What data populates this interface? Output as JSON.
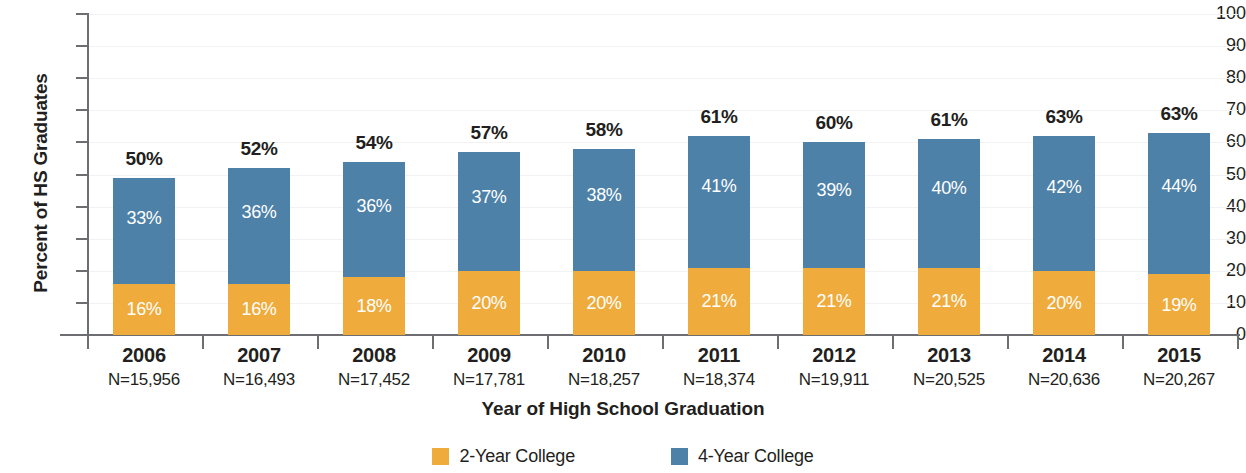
{
  "chart_data": {
    "type": "bar",
    "subtype": "stacked-bar",
    "title": "",
    "xlabel": "Year of High School Graduation",
    "ylabel": "Percent of HS Graduates",
    "ylim": [
      0,
      100
    ],
    "yticks": [
      0,
      10,
      20,
      30,
      40,
      50,
      60,
      70,
      80,
      90,
      100
    ],
    "ytick_labels": [
      "0",
      "10",
      "20",
      "30",
      "40",
      "50",
      "60",
      "70",
      "80",
      "90",
      "100"
    ],
    "grid": true,
    "legend_position": "bottom-center",
    "categories": [
      "2006",
      "2007",
      "2008",
      "2009",
      "2010",
      "2011",
      "2012",
      "2013",
      "2014",
      "2015"
    ],
    "category_sublabels": [
      "N=15,956",
      "N=16,493",
      "N=17,452",
      "N=17,781",
      "N=18,257",
      "N=18,374",
      "N=19,911",
      "N=20,525",
      "N=20,636",
      "N=20,267"
    ],
    "series": [
      {
        "name": "2-Year College",
        "color": "#efab3c",
        "values": [
          16,
          16,
          18,
          20,
          20,
          21,
          21,
          21,
          20,
          19
        ],
        "labels": [
          "16%",
          "16%",
          "18%",
          "20%",
          "20%",
          "21%",
          "21%",
          "21%",
          "20%",
          "19%"
        ]
      },
      {
        "name": "4-Year College",
        "color": "#4e81a8",
        "values": [
          33,
          36,
          36,
          37,
          38,
          41,
          39,
          40,
          42,
          44
        ],
        "labels": [
          "33%",
          "36%",
          "36%",
          "37%",
          "38%",
          "41%",
          "39%",
          "40%",
          "42%",
          "44%"
        ]
      }
    ],
    "totals": [
      49,
      52,
      54,
      57,
      58,
      61,
      60,
      61,
      62,
      62
    ],
    "total_labels": [
      "50%",
      "52%",
      "54%",
      "57%",
      "58%",
      "61%",
      "60%",
      "61%",
      "63%",
      "63%"
    ]
  },
  "legend": {
    "items": [
      {
        "label": "2-Year College",
        "color": "#efab3c"
      },
      {
        "label": "4-Year College",
        "color": "#4e81a8"
      }
    ]
  },
  "colors": {
    "two_year": "#efab3c",
    "four_year": "#4e81a8",
    "axis": "#6d6e71",
    "text": "#231f20",
    "gridline": "#f2f2f2",
    "background": "#ffffff"
  }
}
